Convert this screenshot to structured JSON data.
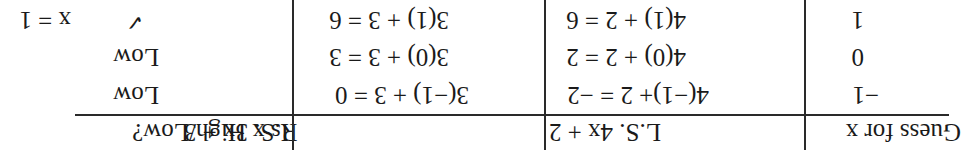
{
  "table": {
    "headers": [
      "Guess for x",
      "L.S. 4x + 2",
      "R.S. 3x + 3",
      "Is x High/Low?"
    ],
    "rows": [
      {
        "guess": "−1",
        "ls": "4(−1)+ 2 = −2",
        "rs": "3(−1) + 3 = 0",
        "result": "Low"
      },
      {
        "guess": "0",
        "ls": "4(0) + 2 = 2",
        "rs": "3(0) + 3 = 3",
        "result": "Low"
      },
      {
        "guess": "1",
        "ls": "4(1) + 2 = 6",
        "rs": "3(1) + 3 = 6",
        "result": "✓"
      }
    ]
  },
  "answer": "x = 1",
  "orientation": "rotated 180°"
}
